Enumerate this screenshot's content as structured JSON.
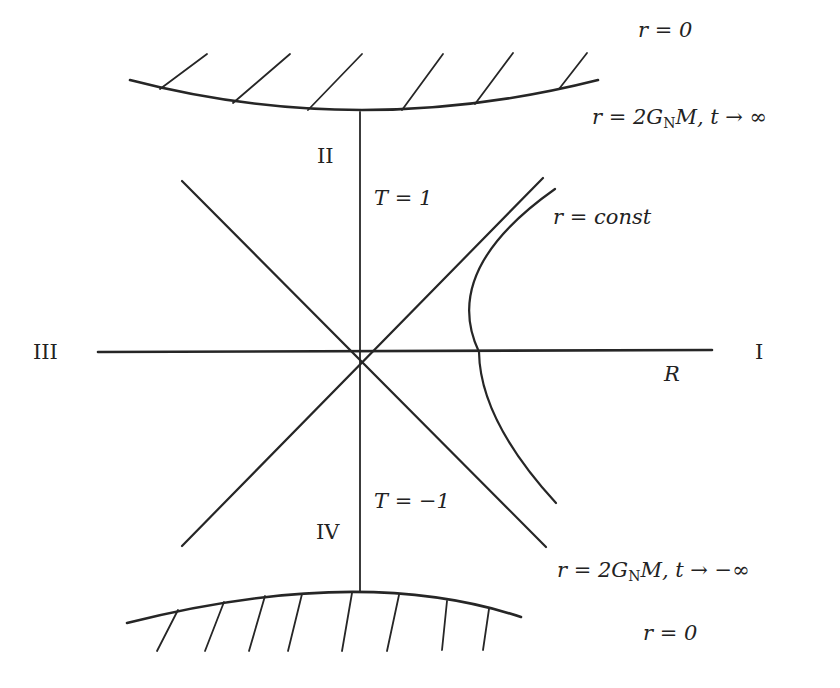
{
  "diagram": {
    "colors": {
      "line": "#262626",
      "text": "#222222",
      "background": "#ffffff"
    },
    "regions": {
      "I": "I",
      "II": "II",
      "III": "III",
      "IV": "IV"
    },
    "labels": {
      "top_singularity": "r = 0",
      "future_horizon": "r = 2G_N M, t → ∞",
      "future_horizon_parts": {
        "pre": "r = 2G",
        "sub": "N",
        "post": "M, t → ∞"
      },
      "T_plus": "T = 1",
      "r_const": "r = const",
      "R_axis": "R",
      "T_minus": "T = −1",
      "past_horizon": "r = 2G_N M, t → −∞",
      "past_horizon_parts": {
        "pre": "r = 2G",
        "sub": "N",
        "post": "M, t → −∞"
      },
      "bottom_singularity": "r = 0"
    },
    "geometry": {
      "origin": [
        360,
        352
      ],
      "R_axis": {
        "x1": 98,
        "y1": 352,
        "x2": 712,
        "y2": 350
      },
      "T_axis": {
        "x1": 360,
        "y1": 112,
        "x2": 360,
        "y2": 591
      },
      "diag_down": {
        "x1": 182,
        "y1": 181,
        "x2": 546,
        "y2": 547
      },
      "diag_up": {
        "x1": 182,
        "y1": 546,
        "x2": 543,
        "y2": 178
      },
      "top_curve": "M 130 80 Q 360 140 598 80",
      "bottom_curve": "M 127 623 Q 360 564 521 617",
      "hyperbola": "M 555 189 Q 440 270 479 352 Q 480 420 556 503",
      "top_hatches": [
        [
          160,
          89,
          207,
          54
        ],
        [
          233,
          103,
          290,
          54
        ],
        [
          308,
          110,
          362,
          54
        ],
        [
          402,
          110,
          443,
          54
        ],
        [
          475,
          104,
          513,
          53
        ],
        [
          559,
          89,
          587,
          53
        ]
      ],
      "bottom_hatches": [
        [
          178,
          610,
          157,
          651
        ],
        [
          224,
          602,
          205,
          651
        ],
        [
          265,
          596,
          249,
          651
        ],
        [
          302,
          594,
          288,
          651
        ],
        [
          352,
          593,
          342,
          651
        ],
        [
          399,
          595,
          387,
          651
        ],
        [
          447,
          601,
          442,
          650
        ],
        [
          489,
          609,
          483,
          650
        ]
      ]
    }
  }
}
